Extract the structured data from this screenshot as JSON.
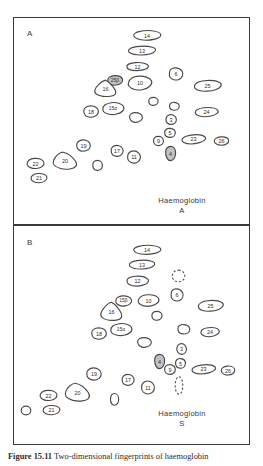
{
  "figure": {
    "caption_label": "Figure 15.11",
    "caption_text": "Two-dimensional fingerprints of haemoglobin",
    "background_color": "#ffffff",
    "outline_color": "#4a4747",
    "frame_color": "#3b3b3b"
  },
  "panels": [
    {
      "id": "panel-a",
      "letter": "A",
      "caption_line1": "Haemoglobin",
      "caption_line2": "A",
      "spots": [
        {
          "label": "14",
          "x": 131,
          "y": 26,
          "w": 30,
          "h": 17,
          "style": "plain",
          "shape": "blob-a"
        },
        {
          "label": "13",
          "x": 126,
          "y": 42,
          "w": 30,
          "h": 15,
          "style": "plain",
          "shape": "blob-b"
        },
        {
          "label": "12",
          "x": 124,
          "y": 59,
          "w": 25,
          "h": 13,
          "style": "plain",
          "shape": "blob-c"
        },
        {
          "label": "6",
          "x": 166,
          "y": 65,
          "w": 18,
          "h": 16,
          "style": "plain",
          "shape": "blob-d"
        },
        {
          "label": "25β",
          "x": 105,
          "y": 73,
          "w": 18,
          "h": 13,
          "style": "hatched",
          "shape": "blob-e"
        },
        {
          "label": "10",
          "x": 126,
          "y": 73,
          "w": 26,
          "h": 18,
          "style": "plain",
          "shape": "blob-f"
        },
        {
          "label": "16",
          "x": 92,
          "y": 78,
          "w": 25,
          "h": 19,
          "style": "plain",
          "shape": "blob-g"
        },
        {
          "label": "25",
          "x": 192,
          "y": 76,
          "w": 29,
          "h": 17,
          "style": "plain",
          "shape": "blob-h"
        },
        {
          "label": "",
          "x": 146,
          "y": 95,
          "w": 13,
          "h": 11,
          "style": "plain",
          "shape": "blob-i"
        },
        {
          "label": "18",
          "x": 81,
          "y": 103,
          "w": 18,
          "h": 15,
          "style": "plain",
          "shape": "blob-j"
        },
        {
          "label": "15α",
          "x": 100,
          "y": 99,
          "w": 24,
          "h": 17,
          "style": "plain",
          "shape": "blob-k"
        },
        {
          "label": "",
          "x": 167,
          "y": 100,
          "w": 13,
          "h": 11,
          "style": "plain",
          "shape": "blob-l"
        },
        {
          "label": "24",
          "x": 193,
          "y": 104,
          "w": 25,
          "h": 14,
          "style": "plain",
          "shape": "blob-m"
        },
        {
          "label": "",
          "x": 127,
          "y": 110,
          "w": 16,
          "h": 13,
          "style": "plain",
          "shape": "blob-n"
        },
        {
          "label": "3",
          "x": 163,
          "y": 112,
          "w": 14,
          "h": 13,
          "style": "plain",
          "shape": "blob-o"
        },
        {
          "label": "5",
          "x": 162,
          "y": 126,
          "w": 14,
          "h": 12,
          "style": "plain",
          "shape": "blob-p"
        },
        {
          "label": "9",
          "x": 151,
          "y": 134,
          "w": 13,
          "h": 12,
          "style": "plain",
          "shape": "blob-q"
        },
        {
          "label": "23",
          "x": 180,
          "y": 131,
          "w": 25,
          "h": 14,
          "style": "plain",
          "shape": "blob-r"
        },
        {
          "label": "26",
          "x": 212,
          "y": 134,
          "w": 17,
          "h": 12,
          "style": "plain",
          "shape": "blob-s"
        },
        {
          "label": "4",
          "x": 162,
          "y": 144,
          "w": 15,
          "h": 17,
          "style": "hatched",
          "shape": "blob-t"
        },
        {
          "label": "19",
          "x": 74,
          "y": 137,
          "w": 17,
          "h": 15,
          "style": "plain",
          "shape": "blob-u"
        },
        {
          "label": "17",
          "x": 108,
          "y": 143,
          "w": 16,
          "h": 14,
          "style": "plain",
          "shape": "blob-v"
        },
        {
          "label": "11",
          "x": 125,
          "y": 148,
          "w": 16,
          "h": 16,
          "style": "plain",
          "shape": "blob-w"
        },
        {
          "label": "20",
          "x": 51,
          "y": 150,
          "w": 26,
          "h": 20,
          "style": "plain",
          "shape": "blob-x"
        },
        {
          "label": "22",
          "x": 25,
          "y": 155,
          "w": 19,
          "h": 15,
          "style": "plain",
          "shape": "blob-y"
        },
        {
          "label": "",
          "x": 90,
          "y": 158,
          "w": 13,
          "h": 13,
          "style": "plain",
          "shape": "blob-z"
        },
        {
          "label": "21",
          "x": 29,
          "y": 170,
          "w": 18,
          "h": 14,
          "style": "plain",
          "shape": "blob-aa"
        }
      ]
    },
    {
      "id": "panel-b",
      "letter": "B",
      "caption_line1": "Haemoglobin",
      "caption_line2": "S",
      "spots": [
        {
          "label": "14",
          "x": 131,
          "y": 241,
          "w": 30,
          "h": 16,
          "style": "plain",
          "shape": "blob-a"
        },
        {
          "label": "13",
          "x": 127,
          "y": 256,
          "w": 28,
          "h": 15,
          "style": "plain",
          "shape": "blob-b"
        },
        {
          "label": "12",
          "x": 124,
          "y": 272,
          "w": 25,
          "h": 16,
          "style": "plain",
          "shape": "blob-c"
        },
        {
          "label": "",
          "x": 170,
          "y": 268,
          "w": 15,
          "h": 14,
          "style": "absent",
          "shape": "blob-circ"
        },
        {
          "label": "6",
          "x": 168,
          "y": 286,
          "w": 16,
          "h": 16,
          "style": "plain",
          "shape": "blob-d"
        },
        {
          "label": "15β",
          "x": 113,
          "y": 293,
          "w": 19,
          "h": 14,
          "style": "plain",
          "shape": "blob-e"
        },
        {
          "label": "10",
          "x": 136,
          "y": 292,
          "w": 23,
          "h": 15,
          "style": "plain",
          "shape": "blob-f"
        },
        {
          "label": "16",
          "x": 98,
          "y": 300,
          "w": 25,
          "h": 21,
          "style": "plain",
          "shape": "blob-g"
        },
        {
          "label": "25",
          "x": 196,
          "y": 296,
          "w": 27,
          "h": 17,
          "style": "plain",
          "shape": "blob-h"
        },
        {
          "label": "",
          "x": 149,
          "y": 309,
          "w": 14,
          "h": 12,
          "style": "plain",
          "shape": "blob-i"
        },
        {
          "label": "18",
          "x": 89,
          "y": 325,
          "w": 18,
          "h": 15,
          "style": "plain",
          "shape": "blob-j"
        },
        {
          "label": "15α",
          "x": 108,
          "y": 320,
          "w": 24,
          "h": 17,
          "style": "plain",
          "shape": "blob-k"
        },
        {
          "label": "",
          "x": 175,
          "y": 322,
          "w": 16,
          "h": 13,
          "style": "plain",
          "shape": "blob-l"
        },
        {
          "label": "24",
          "x": 199,
          "y": 324,
          "w": 20,
          "h": 14,
          "style": "plain",
          "shape": "blob-m"
        },
        {
          "label": "",
          "x": 135,
          "y": 335,
          "w": 17,
          "h": 13,
          "style": "plain",
          "shape": "blob-n"
        },
        {
          "label": "3",
          "x": 174,
          "y": 341,
          "w": 13,
          "h": 14,
          "style": "plain",
          "shape": "blob-o"
        },
        {
          "label": "4",
          "x": 151,
          "y": 352,
          "w": 15,
          "h": 17,
          "style": "hatched",
          "shape": "blob-t"
        },
        {
          "label": "5",
          "x": 173,
          "y": 356,
          "w": 13,
          "h": 13,
          "style": "plain",
          "shape": "blob-p"
        },
        {
          "label": "9",
          "x": 162,
          "y": 362,
          "w": 14,
          "h": 13,
          "style": "plain",
          "shape": "blob-q"
        },
        {
          "label": "23",
          "x": 190,
          "y": 361,
          "w": 25,
          "h": 14,
          "style": "plain",
          "shape": "blob-r"
        },
        {
          "label": "26",
          "x": 219,
          "y": 363,
          "w": 16,
          "h": 13,
          "style": "plain",
          "shape": "blob-s"
        },
        {
          "label": "",
          "x": 173,
          "y": 375,
          "w": 10,
          "h": 19,
          "style": "absent",
          "shape": "blob-ell"
        },
        {
          "label": "19",
          "x": 84,
          "y": 365,
          "w": 18,
          "h": 16,
          "style": "plain",
          "shape": "blob-u"
        },
        {
          "label": "17",
          "x": 119,
          "y": 372,
          "w": 16,
          "h": 14,
          "style": "plain",
          "shape": "blob-v"
        },
        {
          "label": "11",
          "x": 139,
          "y": 378,
          "w": 16,
          "h": 17,
          "style": "plain",
          "shape": "blob-w"
        },
        {
          "label": "20",
          "x": 63,
          "y": 381,
          "w": 27,
          "h": 21,
          "style": "plain",
          "shape": "blob-x"
        },
        {
          "label": "22",
          "x": 38,
          "y": 387,
          "w": 19,
          "h": 15,
          "style": "plain",
          "shape": "blob-y"
        },
        {
          "label": "",
          "x": 108,
          "y": 391,
          "w": 11,
          "h": 15,
          "style": "plain",
          "shape": "blob-z"
        },
        {
          "label": "21",
          "x": 41,
          "y": 402,
          "w": 19,
          "h": 14,
          "style": "plain",
          "shape": "blob-aa"
        },
        {
          "label": "",
          "x": 19,
          "y": 404,
          "w": 12,
          "h": 11,
          "style": "plain",
          "shape": "blob-circ2"
        }
      ]
    }
  ]
}
